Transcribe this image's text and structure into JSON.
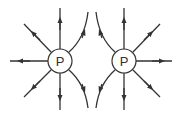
{
  "charges": [
    {
      "label": "P",
      "cx": 60,
      "cy": 61
    },
    {
      "label": "P",
      "cx": 124,
      "cy": 61
    }
  ],
  "colors": {
    "line": "#333333",
    "circle_fill": "#ffffff"
  }
}
